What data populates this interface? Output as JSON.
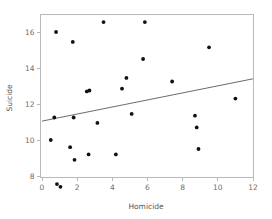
{
  "chart_data": {
    "type": "scatter",
    "title": "",
    "xlabel": "Homicide",
    "ylabel": "Suicide",
    "xlim": [
      0,
      12
    ],
    "ylim": [
      7.0,
      17.0
    ],
    "xticks": [
      0,
      2,
      4,
      6,
      8,
      10,
      12
    ],
    "xticklabels": [
      "0",
      "2",
      "4",
      "6",
      "8",
      "10",
      "12"
    ],
    "yticks": [
      8,
      10,
      12,
      14,
      16
    ],
    "yticklabels": [
      "8",
      "10",
      "12",
      "14",
      "16"
    ],
    "grid": false,
    "legend": null,
    "points": [
      {
        "x": 0.5,
        "y": 10.0
      },
      {
        "x": 0.7,
        "y": 11.25
      },
      {
        "x": 0.8,
        "y": 16.0
      },
      {
        "x": 0.85,
        "y": 7.55
      },
      {
        "x": 1.05,
        "y": 7.4
      },
      {
        "x": 1.6,
        "y": 9.6
      },
      {
        "x": 1.75,
        "y": 15.45
      },
      {
        "x": 1.8,
        "y": 11.25
      },
      {
        "x": 1.85,
        "y": 8.9
      },
      {
        "x": 2.55,
        "y": 12.7
      },
      {
        "x": 2.7,
        "y": 12.75
      },
      {
        "x": 2.65,
        "y": 9.2
      },
      {
        "x": 3.15,
        "y": 10.95
      },
      {
        "x": 3.5,
        "y": 16.55
      },
      {
        "x": 4.2,
        "y": 9.2
      },
      {
        "x": 4.55,
        "y": 12.85
      },
      {
        "x": 4.8,
        "y": 13.45
      },
      {
        "x": 5.1,
        "y": 11.45
      },
      {
        "x": 5.75,
        "y": 14.5
      },
      {
        "x": 5.85,
        "y": 16.55
      },
      {
        "x": 7.4,
        "y": 13.25
      },
      {
        "x": 8.7,
        "y": 11.35
      },
      {
        "x": 8.8,
        "y": 10.7
      },
      {
        "x": 8.9,
        "y": 9.5
      },
      {
        "x": 9.5,
        "y": 15.15
      },
      {
        "x": 11.0,
        "y": 12.3
      }
    ],
    "trendline": {
      "x0": 0,
      "y0": 11.05,
      "x1": 12,
      "y1": 13.4
    },
    "colors": {
      "point": "#111111",
      "trendline": "#5a5a5a",
      "frame": "#b9b9b9",
      "text": "#6e6e6e",
      "background": "#ffffff"
    }
  }
}
